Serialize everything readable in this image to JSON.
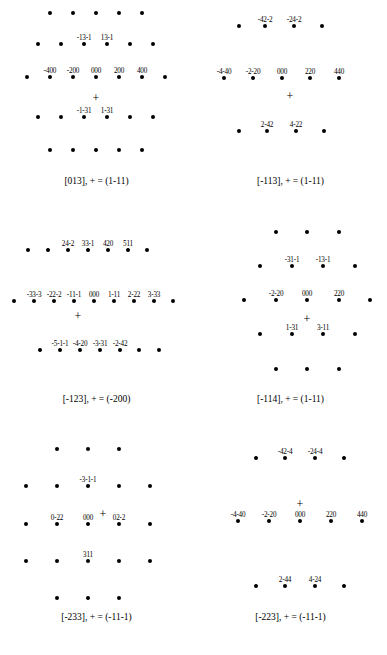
{
  "figure": {
    "background_color": "#ffffff",
    "spot_color": "#000000",
    "panel_count": 6,
    "columns": 2,
    "rows": 3
  },
  "chart_data": {
    "type": "scatter",
    "xlabel": "",
    "ylabel": "",
    "grid": false,
    "legend": "none",
    "panels": [
      {
        "id": "panel-013",
        "caption": "[013], + = (1-11)",
        "zone_axis": "[013]",
        "origin_marker": "+",
        "origin_marker_index": "(1-11)",
        "plus_x": 96,
        "plus_y": 98,
        "spots": [
          {
            "x": 50,
            "y": 13,
            "label": ""
          },
          {
            "x": 73,
            "y": 13,
            "label": ""
          },
          {
            "x": 96,
            "y": 13,
            "label": ""
          },
          {
            "x": 119,
            "y": 13,
            "label": ""
          },
          {
            "x": 142,
            "y": 13,
            "label": ""
          },
          {
            "x": 38,
            "y": 44,
            "label": ""
          },
          {
            "x": 61,
            "y": 44,
            "label": ""
          },
          {
            "x": 84,
            "y": 44,
            "label": "-13-1"
          },
          {
            "x": 107,
            "y": 44,
            "label": "13-1"
          },
          {
            "x": 130,
            "y": 44,
            "label": ""
          },
          {
            "x": 153,
            "y": 44,
            "label": ""
          },
          {
            "x": 27,
            "y": 77,
            "label": ""
          },
          {
            "x": 50,
            "y": 77,
            "label": "-400"
          },
          {
            "x": 73,
            "y": 77,
            "label": "-200"
          },
          {
            "x": 96,
            "y": 77,
            "label": "000"
          },
          {
            "x": 119,
            "y": 77,
            "label": "200"
          },
          {
            "x": 142,
            "y": 77,
            "label": "400"
          },
          {
            "x": 165,
            "y": 77,
            "label": ""
          },
          {
            "x": 38,
            "y": 117,
            "label": ""
          },
          {
            "x": 61,
            "y": 117,
            "label": ""
          },
          {
            "x": 84,
            "y": 117,
            "label": "-1-31"
          },
          {
            "x": 107,
            "y": 117,
            "label": "1-31"
          },
          {
            "x": 130,
            "y": 117,
            "label": ""
          },
          {
            "x": 153,
            "y": 117,
            "label": ""
          },
          {
            "x": 50,
            "y": 150,
            "label": ""
          },
          {
            "x": 73,
            "y": 150,
            "label": ""
          },
          {
            "x": 96,
            "y": 150,
            "label": ""
          },
          {
            "x": 119,
            "y": 150,
            "label": ""
          },
          {
            "x": 142,
            "y": 150,
            "label": ""
          }
        ]
      },
      {
        "id": "panel-113",
        "caption": "[-113], + = (1-11)",
        "zone_axis": "[-113]",
        "origin_marker": "+",
        "origin_marker_index": "(1-11)",
        "plus_x": 96,
        "plus_y": 96,
        "spots": [
          {
            "x": 45,
            "y": 26,
            "label": ""
          },
          {
            "x": 71,
            "y": 26,
            "label": "-42-2"
          },
          {
            "x": 100,
            "y": 26,
            "label": "-24-2"
          },
          {
            "x": 128,
            "y": 26,
            "label": ""
          },
          {
            "x": 30,
            "y": 78,
            "label": "-4-40"
          },
          {
            "x": 59,
            "y": 78,
            "label": "-2-20"
          },
          {
            "x": 88,
            "y": 78,
            "label": "000"
          },
          {
            "x": 116,
            "y": 78,
            "label": "220"
          },
          {
            "x": 145,
            "y": 78,
            "label": "440"
          },
          {
            "x": 45,
            "y": 131,
            "label": ""
          },
          {
            "x": 73,
            "y": 131,
            "label": "2-42"
          },
          {
            "x": 102,
            "y": 131,
            "label": "4-22"
          },
          {
            "x": 130,
            "y": 131,
            "label": ""
          }
        ]
      },
      {
        "id": "panel-123",
        "caption": "[-123], + = (-200)",
        "zone_axis": "[-123]",
        "origin_marker": "+",
        "origin_marker_index": "(-200)",
        "plus_x": 78,
        "plus_y": 98,
        "spots": [
          {
            "x": 28,
            "y": 32,
            "label": ""
          },
          {
            "x": 48,
            "y": 32,
            "label": ""
          },
          {
            "x": 68,
            "y": 32,
            "label": "24-2"
          },
          {
            "x": 88,
            "y": 32,
            "label": "33-1"
          },
          {
            "x": 108,
            "y": 32,
            "label": "420"
          },
          {
            "x": 128,
            "y": 32,
            "label": "511"
          },
          {
            "x": 147,
            "y": 32,
            "label": ""
          },
          {
            "x": 14,
            "y": 83,
            "label": ""
          },
          {
            "x": 34,
            "y": 83,
            "label": "-33-3"
          },
          {
            "x": 54,
            "y": 83,
            "label": "-22-2"
          },
          {
            "x": 74,
            "y": 83,
            "label": "-11-1"
          },
          {
            "x": 94,
            "y": 83,
            "label": "000"
          },
          {
            "x": 114,
            "y": 83,
            "label": "1-11"
          },
          {
            "x": 134,
            "y": 83,
            "label": "2-22"
          },
          {
            "x": 154,
            "y": 83,
            "label": "3-33"
          },
          {
            "x": 173,
            "y": 83,
            "label": ""
          },
          {
            "x": 40,
            "y": 132,
            "label": ""
          },
          {
            "x": 60,
            "y": 132,
            "label": "-5-1-1"
          },
          {
            "x": 80,
            "y": 132,
            "label": "-4-20"
          },
          {
            "x": 100,
            "y": 132,
            "label": "-3-31"
          },
          {
            "x": 120,
            "y": 132,
            "label": "-2-42"
          },
          {
            "x": 139,
            "y": 132,
            "label": ""
          },
          {
            "x": 159,
            "y": 132,
            "label": ""
          }
        ]
      },
      {
        "id": "panel-114",
        "caption": "[-114], + = (1-11)",
        "zone_axis": "[-114]",
        "origin_marker": "+",
        "origin_marker_index": "(1-11)",
        "plus_x": 113,
        "plus_y": 101,
        "spots": [
          {
            "x": 82,
            "y": 14,
            "label": ""
          },
          {
            "x": 113,
            "y": 14,
            "label": ""
          },
          {
            "x": 145,
            "y": 14,
            "label": ""
          },
          {
            "x": 66,
            "y": 48,
            "label": ""
          },
          {
            "x": 98,
            "y": 48,
            "label": "-31-1"
          },
          {
            "x": 129,
            "y": 48,
            "label": "-13-1"
          },
          {
            "x": 161,
            "y": 48,
            "label": ""
          },
          {
            "x": 50,
            "y": 82,
            "label": ""
          },
          {
            "x": 82,
            "y": 82,
            "label": "-2-20"
          },
          {
            "x": 113,
            "y": 82,
            "label": "000"
          },
          {
            "x": 145,
            "y": 82,
            "label": "220"
          },
          {
            "x": 176,
            "y": 82,
            "label": ""
          },
          {
            "x": 66,
            "y": 116,
            "label": ""
          },
          {
            "x": 98,
            "y": 116,
            "label": "1-31"
          },
          {
            "x": 129,
            "y": 116,
            "label": "3-11"
          },
          {
            "x": 161,
            "y": 116,
            "label": ""
          },
          {
            "x": 82,
            "y": 151,
            "label": ""
          },
          {
            "x": 113,
            "y": 151,
            "label": ""
          },
          {
            "x": 145,
            "y": 151,
            "label": ""
          }
        ]
      },
      {
        "id": "panel-233",
        "caption": "[-233], + = (-11-1)",
        "zone_axis": "[-233]",
        "origin_marker": "+",
        "origin_marker_index": "(-11-1)",
        "plus_x": 103,
        "plus_y": 78,
        "spots": [
          {
            "x": 57,
            "y": 13,
            "label": ""
          },
          {
            "x": 88,
            "y": 13,
            "label": ""
          },
          {
            "x": 119,
            "y": 13,
            "label": ""
          },
          {
            "x": 26,
            "y": 50,
            "label": ""
          },
          {
            "x": 57,
            "y": 50,
            "label": ""
          },
          {
            "x": 88,
            "y": 50,
            "label": "-3-1-1"
          },
          {
            "x": 119,
            "y": 50,
            "label": ""
          },
          {
            "x": 150,
            "y": 50,
            "label": ""
          },
          {
            "x": 26,
            "y": 88,
            "label": ""
          },
          {
            "x": 57,
            "y": 88,
            "label": "0-22"
          },
          {
            "x": 88,
            "y": 88,
            "label": "000"
          },
          {
            "x": 119,
            "y": 88,
            "label": "02-2"
          },
          {
            "x": 150,
            "y": 88,
            "label": ""
          },
          {
            "x": 26,
            "y": 125,
            "label": ""
          },
          {
            "x": 57,
            "y": 125,
            "label": ""
          },
          {
            "x": 88,
            "y": 125,
            "label": "311"
          },
          {
            "x": 119,
            "y": 125,
            "label": ""
          },
          {
            "x": 150,
            "y": 125,
            "label": ""
          },
          {
            "x": 57,
            "y": 162,
            "label": ""
          },
          {
            "x": 88,
            "y": 162,
            "label": ""
          },
          {
            "x": 119,
            "y": 162,
            "label": ""
          }
        ]
      },
      {
        "id": "panel-223",
        "caption": "[-223], + = (-11-1)",
        "zone_axis": "[-223]",
        "origin_marker": "+",
        "origin_marker_index": "(-11-1)",
        "plus_x": 106,
        "plus_y": 68,
        "spots": [
          {
            "x": 62,
            "y": 22,
            "label": ""
          },
          {
            "x": 91,
            "y": 22,
            "label": "-42-4"
          },
          {
            "x": 121,
            "y": 22,
            "label": "-24-4"
          },
          {
            "x": 150,
            "y": 22,
            "label": ""
          },
          {
            "x": 44,
            "y": 85,
            "label": "-4-40"
          },
          {
            "x": 75,
            "y": 85,
            "label": "-2-20"
          },
          {
            "x": 106,
            "y": 85,
            "label": "000"
          },
          {
            "x": 137,
            "y": 85,
            "label": "220"
          },
          {
            "x": 168,
            "y": 85,
            "label": "440"
          },
          {
            "x": 62,
            "y": 150,
            "label": ""
          },
          {
            "x": 91,
            "y": 150,
            "label": "2-44"
          },
          {
            "x": 121,
            "y": 150,
            "label": "4-24"
          },
          {
            "x": 150,
            "y": 150,
            "label": ""
          }
        ]
      }
    ]
  }
}
